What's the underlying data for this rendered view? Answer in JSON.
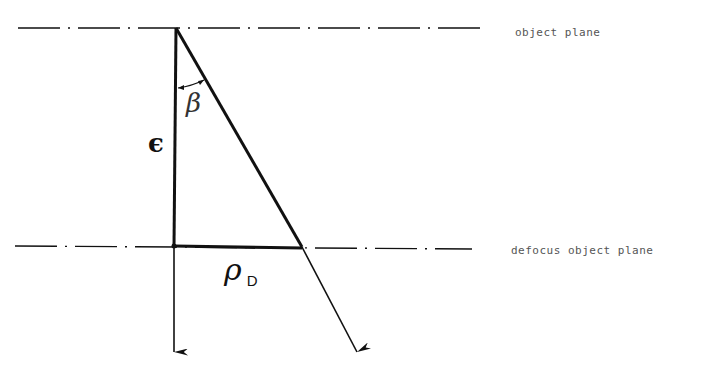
{
  "diagram": {
    "type": "optics-defocus-geometry",
    "planes": [
      {
        "id": "object-plane",
        "label": "object plane",
        "y": 28,
        "x_start": 18,
        "x_end": 480
      },
      {
        "id": "defocus-object-plane",
        "label": "defocus object plane",
        "y": 246,
        "x_start": 15,
        "x_end": 472
      }
    ],
    "symbols": {
      "beta": "β",
      "epsilon": "ϵ",
      "rho": "ρ",
      "rho_subscript": "D"
    },
    "rays": [
      {
        "id": "axial-ray",
        "from": [
          176,
          28
        ],
        "to": [
          174,
          352
        ]
      },
      {
        "id": "oblique-ray",
        "from": [
          176,
          28
        ],
        "via": [
          302,
          246
        ],
        "to": [
          357,
          352
        ]
      }
    ],
    "segments": {
      "epsilon_segment": {
        "from": [
          176,
          28
        ],
        "to": [
          174,
          246
        ]
      },
      "rho_d_segment": {
        "from": [
          174,
          246
        ],
        "to": [
          302,
          246
        ]
      }
    },
    "colors": {
      "line": "#111111",
      "label": "#555555",
      "background": "#ffffff"
    }
  }
}
